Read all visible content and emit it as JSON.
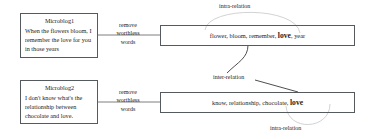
{
  "diagram": {
    "title_visible": false,
    "colors": {
      "box_border": "#555a5e",
      "text": "#1c1c1c",
      "connector": "#6f6f6f",
      "arc_faint": "#c9c9c9",
      "background": "#ffffff"
    },
    "microblogs": [
      {
        "id": "microblog-1",
        "title": "Microblog1",
        "text": "When the flowers bloom, I remember the love for you in those years"
      },
      {
        "id": "microblog-2",
        "title": "Microblog2",
        "text": "I don't know what's the relationship between chocolate and love."
      }
    ],
    "transform_labels": [
      {
        "id": "remove-1",
        "line1": "remove",
        "line2": "worthless",
        "line3": "words"
      },
      {
        "id": "remove-2",
        "line1": "remove",
        "line2": "worthless",
        "line3": "words"
      }
    ],
    "keyword_sets": [
      {
        "id": "keywords-1",
        "prefix": "flower, bloom, remember, ",
        "highlight": "love",
        "suffix": ", year"
      },
      {
        "id": "keywords-2",
        "prefix": "know, relationship, chocolate, ",
        "highlight": "love",
        "suffix": ""
      }
    ],
    "relations": [
      {
        "id": "intra-relation-top",
        "label": "intra-relation"
      },
      {
        "id": "inter-relation-middle",
        "label": "inter-relation"
      },
      {
        "id": "intra-relation-bottom",
        "label": "intra-relation"
      }
    ]
  }
}
